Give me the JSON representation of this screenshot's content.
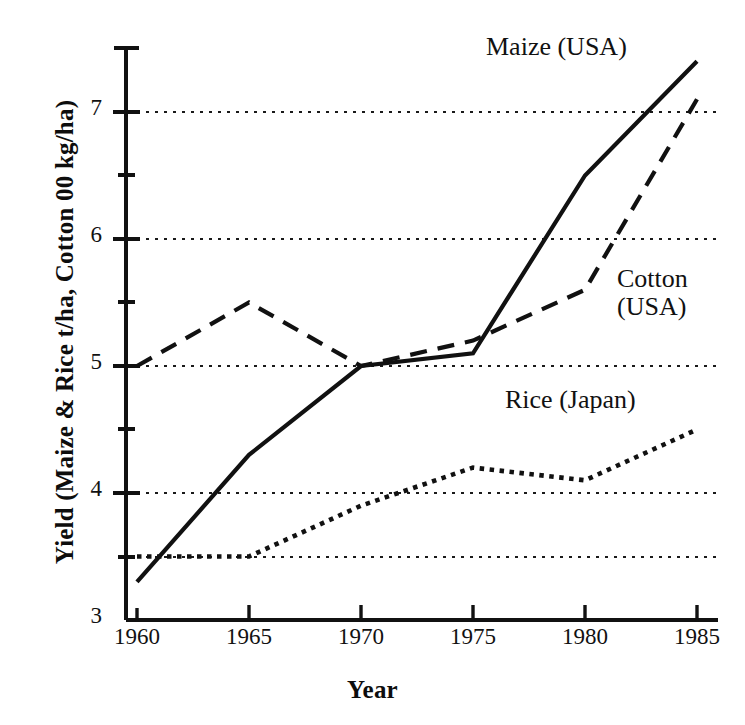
{
  "chart_data": {
    "type": "line",
    "title": "",
    "xlabel": "Year",
    "ylabel": "Yield (Maize & Rice t/ha, Cotton 00 kg/ha)",
    "x": [
      1960,
      1965,
      1970,
      1975,
      1980,
      1985
    ],
    "xlim": [
      1960,
      1985
    ],
    "ylim": [
      3,
      7.5
    ],
    "xticks": [
      "1960",
      "1965",
      "1970",
      "1975",
      "1980",
      "1985"
    ],
    "yticks": [
      "3",
      "4",
      "5",
      "6",
      "7"
    ],
    "y_minor_ticks": [
      3.5,
      4.5,
      5.5,
      6.5
    ],
    "gridlines": [
      3.5,
      4,
      5,
      6,
      7
    ],
    "grid": "horizontal dotted",
    "legend": "inline annotations",
    "series": [
      {
        "name": "Maize (USA)",
        "style": "solid",
        "values": [
          3.3,
          4.3,
          5.0,
          5.1,
          6.5,
          7.4
        ]
      },
      {
        "name": "Cotton (USA)",
        "style": "dashed",
        "values": [
          5.0,
          5.5,
          5.0,
          5.2,
          5.6,
          7.1
        ]
      },
      {
        "name": "Rice (Japan)",
        "style": "dotted",
        "values": [
          3.5,
          3.5,
          3.9,
          4.2,
          4.1,
          4.5
        ]
      }
    ]
  },
  "annotations": {
    "maize": "Maize (USA)",
    "cotton": "Cotton\n(USA)",
    "rice": "Rice (Japan)"
  },
  "axes": {
    "x_title": "Year",
    "y_title": "Yield (Maize & Rice t/ha, Cotton 00 kg/ha)",
    "x_tick_labels": [
      "1960",
      "1965",
      "1970",
      "1975",
      "1980",
      "1985"
    ],
    "y_tick_labels": [
      "3",
      "4",
      "5",
      "6",
      "7"
    ]
  },
  "colors": {
    "ink": "#111111",
    "background": "#ffffff",
    "grid": "#333333"
  }
}
